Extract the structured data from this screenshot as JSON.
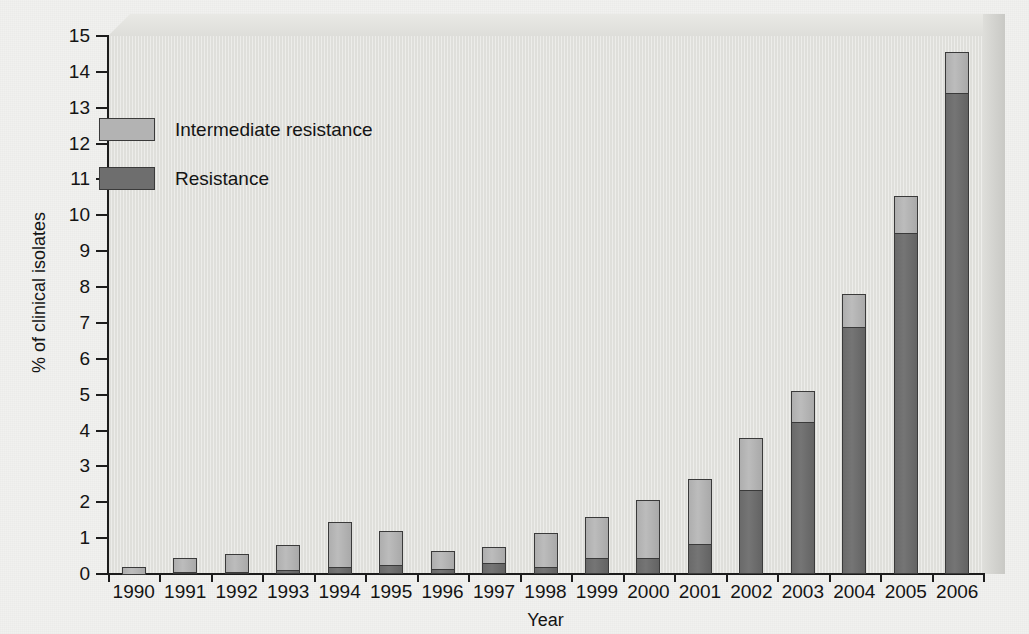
{
  "chart_data": {
    "type": "bar",
    "stacked": true,
    "title": "",
    "xlabel": "Year",
    "ylabel": "% of clinical isolates",
    "ylim": [
      0,
      15
    ],
    "ytick_step": 1,
    "yticks": [
      "0",
      "1",
      "2",
      "3",
      "4",
      "5",
      "6",
      "7",
      "8",
      "9",
      "10",
      "11",
      "12",
      "13",
      "14",
      "15"
    ],
    "grid": false,
    "legend_position": "upper-left-inside",
    "categories": [
      "1990",
      "1991",
      "1992",
      "1993",
      "1994",
      "1995",
      "1996",
      "1997",
      "1998",
      "1999",
      "2000",
      "2001",
      "2002",
      "2003",
      "2004",
      "2005",
      "2006"
    ],
    "series": [
      {
        "name": "Resistance",
        "color": "#6e6e6e",
        "values": [
          0.0,
          0.05,
          0.05,
          0.1,
          0.2,
          0.25,
          0.15,
          0.3,
          0.2,
          0.45,
          0.45,
          0.85,
          2.35,
          4.25,
          6.9,
          9.5,
          13.4
        ]
      },
      {
        "name": "Intermediate resistance",
        "color": "#b3b3b3",
        "values": [
          0.2,
          0.4,
          0.5,
          0.7,
          1.25,
          0.95,
          0.5,
          0.45,
          0.95,
          1.15,
          1.6,
          1.8,
          1.45,
          0.85,
          0.9,
          1.05,
          1.15
        ]
      }
    ],
    "totals": [
      0.2,
      0.45,
      0.55,
      0.8,
      1.45,
      1.2,
      0.65,
      0.75,
      1.15,
      1.6,
      2.05,
      2.65,
      3.8,
      5.1,
      7.8,
      10.55,
      14.55
    ]
  },
  "legend": {
    "items": [
      {
        "label": "Intermediate resistance",
        "color": "#b3b3b3"
      },
      {
        "label": "Resistance",
        "color": "#6e6e6e"
      }
    ]
  },
  "axes": {
    "y_title": "% of clinical isolates",
    "x_title": "Year"
  },
  "style": {
    "plot_background": "#e3e3df",
    "page_background": "#f1f1ef",
    "axis_color": "#1c1c1c",
    "bar_border": "#3a3a3a"
  }
}
